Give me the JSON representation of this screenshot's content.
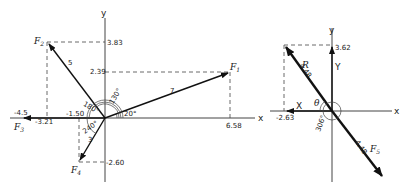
{
  "left_diagram": {
    "axes": {
      "x_label": "x",
      "y_label": "y"
    },
    "forces": [
      {
        "name": "F1",
        "label": "F",
        "sub": "1",
        "magnitude": "7",
        "angle": "20°",
        "x_comp": "6.58",
        "y_comp": "2.39"
      },
      {
        "name": "F2",
        "label": "F",
        "sub": "2",
        "magnitude": "5",
        "angle": "130°",
        "x_comp": "-3.21",
        "y_comp": "3.83"
      },
      {
        "name": "F3",
        "label": "F",
        "sub": "3",
        "magnitude": "4.5",
        "angle": "180°",
        "x_comp": "-4.5",
        "y_comp": "0"
      },
      {
        "name": "F4",
        "label": "F",
        "sub": "4",
        "magnitude": "3",
        "angle": "240°",
        "x_comp": "-1.50",
        "y_comp": "-2.60"
      }
    ],
    "tick_labels": {
      "y_top": "3.83",
      "y_mid": "2.39",
      "y_bottom": "-2.60",
      "x_right": "6.58",
      "x_left_far": "-4.5",
      "x_left": "-3.21",
      "x_near": "-1.50"
    },
    "angle_labels": {
      "a20": "20°",
      "a130": "130°",
      "a180": "180°",
      "a240": "240°"
    },
    "magnitude_labels": {
      "m1": "7",
      "m2": "5",
      "m4": "3"
    }
  },
  "right_diagram": {
    "axes": {
      "x_label": "x",
      "y_label": "y"
    },
    "resultant": {
      "label": "R",
      "magnitude": "4.48",
      "angle_label": "θ"
    },
    "equilibrant": {
      "label": "F",
      "sub": "5",
      "magnitude": "4.48",
      "angle": "306°"
    },
    "components": {
      "X_label": "X",
      "X_value": "-2.63",
      "Y_label": "Y",
      "Y_value": "3.62"
    }
  }
}
